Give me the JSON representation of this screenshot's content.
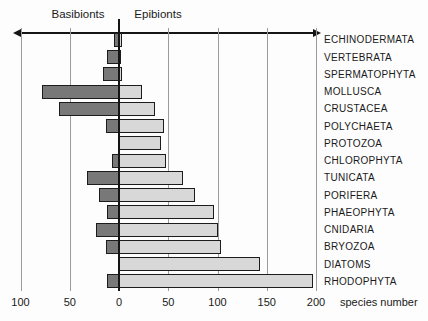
{
  "chart_data": {
    "type": "bar",
    "variant": "diverging-horizontal",
    "left_header": "Basibionts",
    "right_header": "Epibionts",
    "xlabel": "species number",
    "xlim": [
      -100,
      200
    ],
    "grid": true,
    "legend_position": "top",
    "axis_ticks": [
      {
        "value": -100,
        "label": "100"
      },
      {
        "value": -50,
        "label": "50"
      },
      {
        "value": 0,
        "label": "0"
      },
      {
        "value": 50,
        "label": "50"
      },
      {
        "value": 100,
        "label": "100"
      },
      {
        "value": 150,
        "label": "150"
      },
      {
        "value": 200,
        "label": "200"
      }
    ],
    "categories": [
      "ECHINODERMATA",
      "VERTEBRATA",
      "SPERMATOPHYTA",
      "MOLLUSCA",
      "CRUSTACEA",
      "POLYCHAETA",
      "PROTOZOA",
      "CHLOROPHYTA",
      "TUNICATA",
      "PORIFERA",
      "PHAEOPHYTA",
      "CNIDARIA",
      "BRYOZOA",
      "DIATOMS",
      "RHODOPHYTA"
    ],
    "series": [
      {
        "name": "Basibionts",
        "side": "left",
        "color": "#787878",
        "values": [
          5,
          12,
          16,
          78,
          61,
          13,
          0,
          7,
          32,
          20,
          12,
          23,
          13,
          0,
          12
        ]
      },
      {
        "name": "Epibionts",
        "side": "right",
        "color": "#d8d8d8",
        "values": [
          3,
          2,
          3,
          23,
          37,
          46,
          43,
          48,
          65,
          77,
          96,
          100,
          104,
          143,
          197
        ]
      }
    ],
    "colors": {
      "basibiont_bar": "#787878",
      "epibiont_bar": "#d8d8d8",
      "bar_border": "#1c1c1c",
      "gridline": "#9b9b9b",
      "axis": "#151515",
      "text": "#1a1a1a",
      "background": "#fdfdfd"
    }
  }
}
